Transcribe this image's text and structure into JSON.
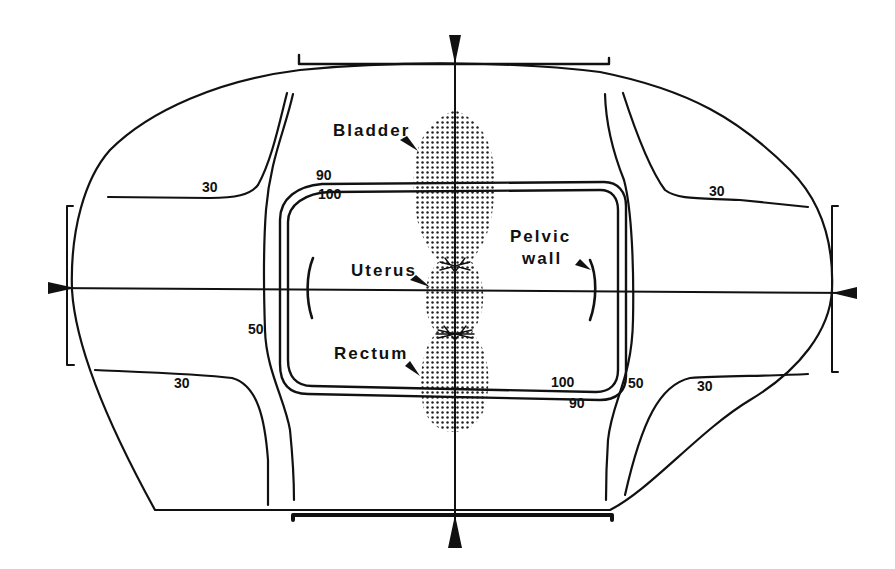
{
  "diagram": {
    "type": "isodose-distribution",
    "colors": {
      "line": "#111111",
      "stipple": "#222222",
      "background": "#ffffff"
    },
    "structures": {
      "bladder": "Bladder",
      "uterus": "Uterus",
      "rectum": "Rectum",
      "pelvic_wall_line1": "Pelvic",
      "pelvic_wall_line2": "wall"
    },
    "isodose_labels": {
      "upper_left_30": "30",
      "upper_right_30": "30",
      "lower_left_30": "30",
      "lower_right_30": "30",
      "left_50": "50",
      "right_50": "50",
      "upper_90": "90",
      "upper_100": "100",
      "lower_100": "100",
      "lower_90": "90"
    },
    "isodose_levels": [
      30,
      50,
      90,
      100
    ],
    "beams": [
      "anterior",
      "posterior",
      "left-lateral",
      "right-lateral"
    ],
    "markers": {
      "top": "arrowhead-down",
      "bottom": "arrowhead-up",
      "left": "arrowhead-right",
      "right": "arrowhead-left"
    }
  }
}
